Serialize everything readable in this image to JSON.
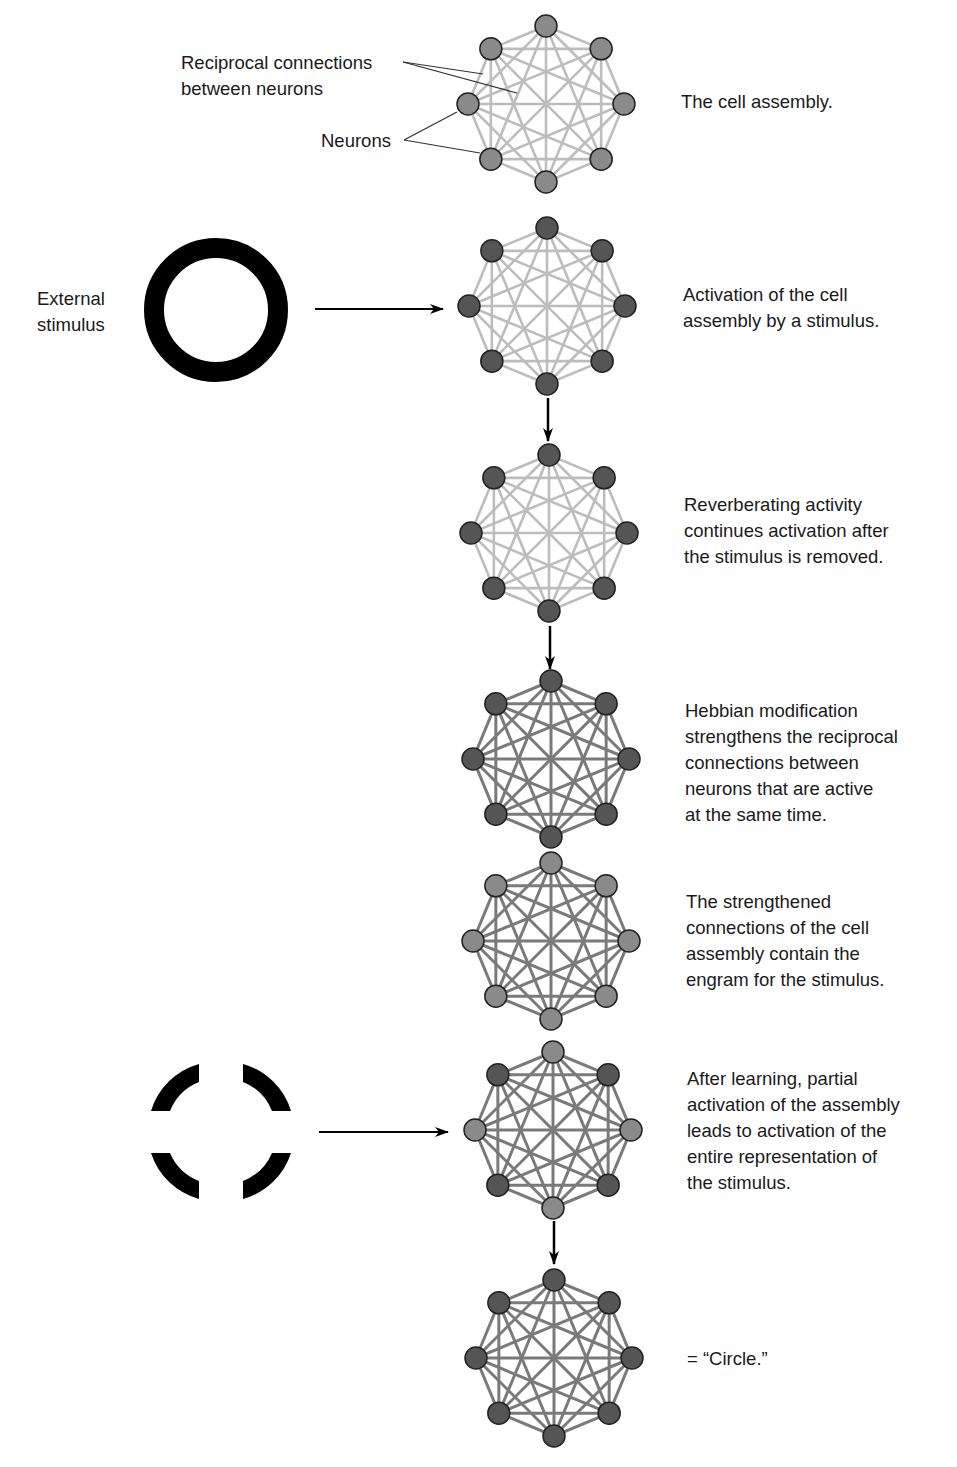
{
  "labels": {
    "reciprocal": "Reciprocal connections\nbetween neurons",
    "neurons": "Neurons",
    "external_stimulus": "External\nstimulus"
  },
  "colors": {
    "neuron_inactive": "#8a8a8a",
    "neuron_active": "#555555",
    "connection_weak": "#bdbdbd",
    "connection_strong": "#7a7a7a",
    "stimulus": "#000000"
  },
  "stages": [
    {
      "id": "cell-assembly",
      "caption": "The cell assembly.",
      "center": [
        546,
        104
      ],
      "connections": "weak",
      "active_neurons": []
    },
    {
      "id": "activation",
      "caption": "Activation of the cell\nassembly by a stimulus.",
      "center": [
        547,
        306
      ],
      "connections": "weak",
      "active_neurons": [
        0,
        1,
        2,
        3,
        4,
        5,
        6,
        7
      ]
    },
    {
      "id": "reverberation",
      "caption": "Reverberating activity\ncontinues activation after\nthe stimulus is removed.",
      "center": [
        549,
        533
      ],
      "connections": "weak",
      "active_neurons": [
        0,
        1,
        2,
        3,
        4,
        5,
        6,
        7
      ]
    },
    {
      "id": "hebbian",
      "caption": "Hebbian modification\nstrengthens the reciprocal\nconnections between\nneurons that are active\nat the same time.",
      "center": [
        551,
        759
      ],
      "connections": "strong",
      "active_neurons": [
        0,
        1,
        2,
        3,
        4,
        5,
        6,
        7
      ]
    },
    {
      "id": "engram",
      "caption": "The strengthened\nconnections of the cell\nassembly contain the\nengram for the stimulus.",
      "center": [
        551,
        941
      ],
      "connections": "strong",
      "active_neurons": []
    },
    {
      "id": "partial",
      "caption": "After learning, partial\nactivation of the assembly\nleads to activation of the\nentire representation of\nthe stimulus.",
      "center": [
        553,
        1130
      ],
      "connections": "strong",
      "active_neurons": [
        1,
        3,
        5,
        7
      ]
    },
    {
      "id": "circle",
      "caption": "= “Circle.”",
      "center": [
        554,
        1358
      ],
      "connections": "strong",
      "active_neurons": [
        0,
        1,
        2,
        3,
        4,
        5,
        6,
        7
      ]
    }
  ],
  "stimuli": [
    {
      "name": "full-circle-stimulus",
      "shape": "ring",
      "center": [
        216,
        310
      ]
    },
    {
      "name": "partial-circle-stimulus",
      "shape": "broken-ring",
      "center": [
        221,
        1131
      ]
    }
  ]
}
